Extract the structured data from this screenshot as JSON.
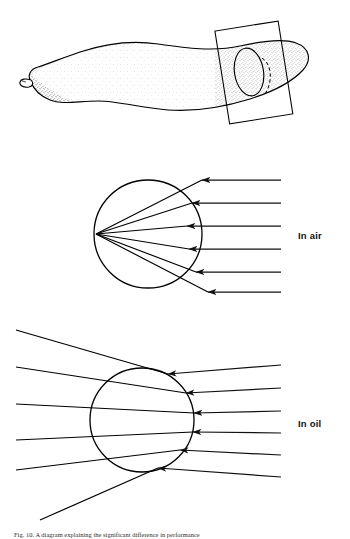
{
  "figure": {
    "background_color": "#ffffff",
    "ink_color": "#000000",
    "caption": {
      "text": "Fig. 10. A diagram explaining the significant difference in performance",
      "visible_fraction": "top sliver only, clipped by image edge",
      "top": 531,
      "height": 8
    }
  },
  "chart_data": {
    "type": "diagram",
    "panels": [
      {
        "id": "specimen",
        "name": "specimen-drawing",
        "label": "",
        "description": "Stippled elongate worm-like organism shown in lateral view with a cutting plane near its posterior end",
        "organism": {
          "outline_style": "stippled",
          "head_end": "left",
          "tail_end": "right",
          "head_feature": "small rounded proboscis"
        },
        "section_plane": {
          "shape": "rectangle",
          "rotation_deg": -10,
          "cut_face": "ellipse",
          "hidden_edge_style": "dashed"
        }
      },
      {
        "id": "in-air",
        "name": "ray-diagram-in-air",
        "label": "In air",
        "medium": "air",
        "label_x": 298,
        "label_y": 236,
        "lens": {
          "cx": 148,
          "cy": 234,
          "r": 54
        },
        "ray_count": 6,
        "ray_direction": "right-to-left",
        "ray_start_x": 281,
        "ray_y": [
          180,
          203,
          226,
          249,
          272,
          292
        ],
        "arrowhead_x": 250,
        "behavior": "converging",
        "focal_point": {
          "x": 96,
          "y": 234
        },
        "focus_note": "rays converge to a sharp focus at the left margin of the sphere"
      },
      {
        "id": "in-oil",
        "name": "ray-diagram-in-oil",
        "label": "In oil",
        "medium": "oil",
        "label_x": 298,
        "label_y": 424,
        "lens": {
          "cx": 142,
          "cy": 420,
          "r": 52
        },
        "ray_count": 6,
        "ray_direction": "right-to-left",
        "ray_start_x": 281,
        "ray_y": [
          365,
          388,
          411,
          433,
          455,
          477
        ],
        "arrowhead_x": 250,
        "behavior": "diverging",
        "exit_x": 16,
        "exit_y": [
          330,
          367,
          404,
          440,
          470,
          520
        ],
        "focus_note": "rays are only weakly refracted and spread apart; no focus is formed"
      }
    ],
    "legend_entries": [
      "In air",
      "In oil"
    ],
    "annotations": []
  }
}
